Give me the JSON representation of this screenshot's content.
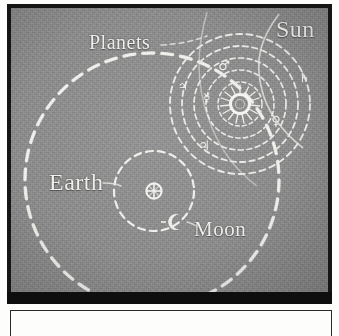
{
  "figure": {
    "kind": "astronomical-diagram",
    "system_name": "Tychonic (geo-heliocentric) system",
    "background_color": "#8c8c8c",
    "ink_color": "#eeeeea",
    "frame_color": "#151515",
    "labels": {
      "planets": "Planets",
      "sun": "Sun",
      "earth": "Earth",
      "moon": "Moon"
    },
    "symbols": {
      "sun": "sun-with-rays",
      "earth": "⊕",
      "moon": "☾",
      "mars": "♂",
      "jupiter": "♃",
      "saturn": "♄",
      "venus": "♀",
      "mercury": "☿"
    },
    "orbits": {
      "sun_orbit_around_earth": {
        "center_x": 141,
        "center_y": 172,
        "radius": 127,
        "style": "dashed"
      },
      "moon_orbit_around_earth": {
        "center_x": 143,
        "center_y": 183,
        "radius": 40,
        "style": "dashed"
      },
      "planet_orbits_around_sun": [
        {
          "name": "Mercury",
          "radius": 22,
          "symbol": "☿"
        },
        {
          "name": "Venus",
          "radius": 34,
          "symbol": "♀"
        },
        {
          "name": "Mars",
          "radius": 46,
          "symbol": "♂"
        },
        {
          "name": "Jupiter",
          "radius": 58,
          "symbol": "♃"
        },
        {
          "name": "Saturn",
          "radius": 70,
          "symbol": "♄"
        }
      ],
      "sun_center": {
        "x": 229,
        "y": 96
      }
    }
  }
}
